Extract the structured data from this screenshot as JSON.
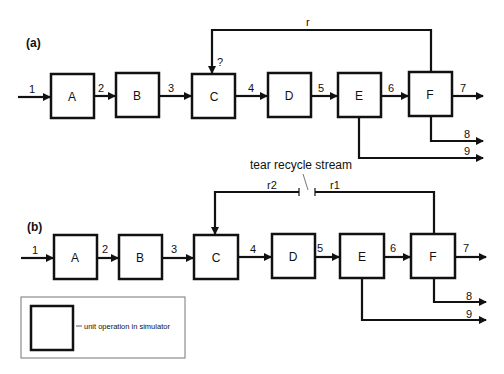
{
  "panel_a": {
    "label": "(a)",
    "units": [
      {
        "id": "A",
        "label": "A"
      },
      {
        "id": "B",
        "label": "B"
      },
      {
        "id": "C",
        "label": "C"
      },
      {
        "id": "D",
        "label": "D"
      },
      {
        "id": "E",
        "label": "E"
      },
      {
        "id": "F",
        "label": "F"
      }
    ],
    "streams": [
      "1",
      "2",
      "3",
      "4",
      "5",
      "6",
      "7",
      "8",
      "9"
    ],
    "recycle_label": "r",
    "unknown_marker": "?"
  },
  "panel_b": {
    "label": "(b)",
    "units": [
      {
        "id": "A",
        "label": "A"
      },
      {
        "id": "B",
        "label": "B"
      },
      {
        "id": "C",
        "label": "C"
      },
      {
        "id": "D",
        "label": "D"
      },
      {
        "id": "E",
        "label": "E"
      },
      {
        "id": "F",
        "label": "F"
      }
    ],
    "streams": [
      "1",
      "2",
      "3",
      "4",
      "5",
      "6",
      "7",
      "8",
      "9"
    ],
    "recycle_out_label": "r1",
    "recycle_in_label": "r2",
    "tear_label": "tear recycle stream"
  },
  "legend": {
    "text": "unit operation in simulator"
  }
}
